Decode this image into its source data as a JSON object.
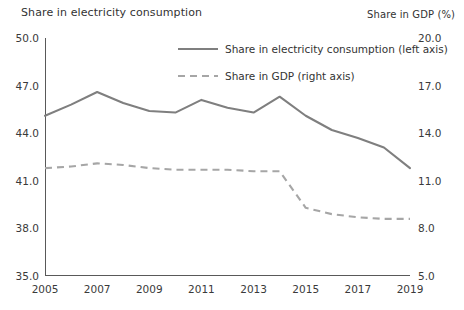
{
  "header": {
    "left_axis_title": "Share in electricity consumption",
    "right_axis_title": "Share in GDP (%)"
  },
  "legend": {
    "items": [
      {
        "label": "Share in electricity consumption (left axis)",
        "style": "solid",
        "color": "#7f7f7f"
      },
      {
        "label": "Share in GDP (right axis)",
        "style": "dashed",
        "color": "#a6a6a6"
      }
    ]
  },
  "axes": {
    "left_ticks": [
      "50.0",
      "47.0",
      "44.0",
      "41.0",
      "38.0",
      "35.0"
    ],
    "right_ticks": [
      "20.0",
      "17.0",
      "14.0",
      "11.0",
      "8.0",
      "5.0"
    ],
    "x_ticks": [
      "2005",
      "2007",
      "2009",
      "2011",
      "2013",
      "2015",
      "2017",
      "2019"
    ]
  },
  "chart_data": {
    "type": "line",
    "title": "",
    "xlabel": "",
    "ylabel": "Share in electricity consumption",
    "y2label": "Share in GDP (%)",
    "ylim": [
      35.0,
      50.0
    ],
    "y2lim": [
      5.0,
      20.0
    ],
    "yticks": [
      35.0,
      38.0,
      41.0,
      44.0,
      47.0,
      50.0
    ],
    "y2ticks": [
      5.0,
      8.0,
      11.0,
      14.0,
      17.0,
      20.0
    ],
    "grid": false,
    "legend_position": "upper-center",
    "x": [
      2005,
      2006,
      2007,
      2008,
      2009,
      2010,
      2011,
      2012,
      2013,
      2014,
      2015,
      2016,
      2017,
      2018,
      2019
    ],
    "xticklabels": [
      "2005",
      "2007",
      "2009",
      "2011",
      "2013",
      "2015",
      "2017",
      "2019"
    ],
    "series": [
      {
        "name": "Share in electricity consumption (left axis)",
        "axis": "left",
        "style": "solid",
        "color": "#7f7f7f",
        "values": [
          45.1,
          45.8,
          46.6,
          45.9,
          45.4,
          45.3,
          46.1,
          45.6,
          45.3,
          46.3,
          45.1,
          44.2,
          43.7,
          43.1,
          41.8
        ]
      },
      {
        "name": "Share in GDP (right axis)",
        "axis": "right",
        "style": "dashed",
        "color": "#a6a6a6",
        "values": [
          11.8,
          11.9,
          12.1,
          12.0,
          11.8,
          11.7,
          11.7,
          11.7,
          11.6,
          11.6,
          9.3,
          8.9,
          8.7,
          8.6,
          8.6
        ]
      }
    ]
  }
}
